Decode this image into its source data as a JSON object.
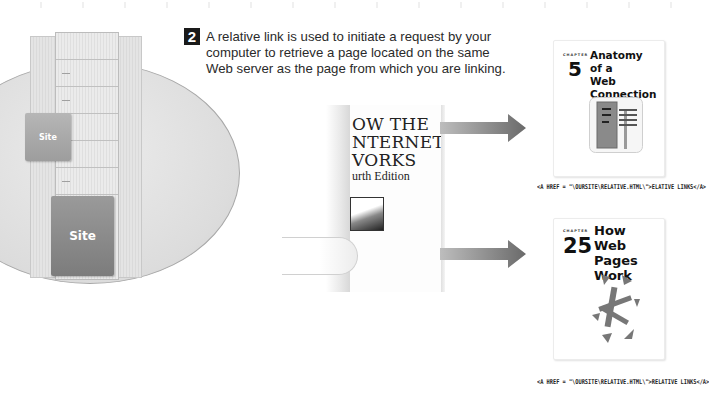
{
  "step": {
    "number": "2",
    "caption": "A relative link is used to initiate a request by your computer to retrieve a page located on the same Web server as the page from which you are linking."
  },
  "server_graphic": {
    "site_small_label": "Site",
    "site_large_label": "Site"
  },
  "book": {
    "title_lines": [
      "OW THE",
      "NTERNET",
      "VORKS"
    ],
    "edition": "urth Edition"
  },
  "chapters": [
    {
      "label": "CHAPTER",
      "number": "5",
      "title_lines": [
        "Anatomy",
        "of a",
        "Web Connection"
      ],
      "icon": "server-rack-icon",
      "href": "<A HREF = \"\\OURSITE\\RELATIVE.HTML\\\">ELATIVE LINKS</A>"
    },
    {
      "label": "CHAPTER",
      "number": "25",
      "title_lines": [
        "How",
        "Web Pages",
        "Work"
      ],
      "icon": "scattered-arrows-icon",
      "href": "<A HREF = \"\\OURSITE\\RELATIVE.HTML\\\">RELATIVE LINKS</A>"
    }
  ],
  "colors": {
    "circle_fill": "#dcdcdc",
    "circle_border": "#a8a8a8",
    "arrow_gray": "#6f6f6f",
    "badge": "#1a1a1a",
    "text": "#2a2a2a"
  }
}
